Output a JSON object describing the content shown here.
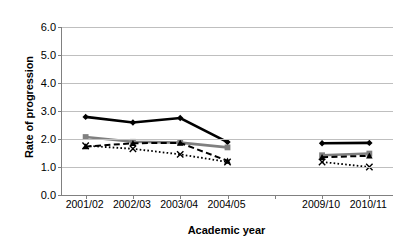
{
  "chart_data": {
    "type": "line",
    "title": "",
    "xlabel": "Academic year",
    "ylabel": "Rate of progression",
    "categories": [
      "2001/02",
      "2002/03",
      "2003/04",
      "2004/05",
      "",
      "2009/10",
      "2010/11"
    ],
    "visible_categories": [
      "2001/02",
      "2002/03",
      "2003/04",
      "2004/05",
      "2009/10",
      "2010/11"
    ],
    "ylim": [
      0.0,
      6.0
    ],
    "ytick_labels": [
      "0.0",
      "1.0",
      "2.0",
      "3.0",
      "4.0",
      "5.0",
      "6.0"
    ],
    "ytick_values": [
      0.0,
      1.0,
      2.0,
      3.0,
      4.0,
      5.0,
      6.0
    ],
    "grid": true,
    "grid_axis": "y",
    "legend": "none",
    "gap_note": "Years 2005/06 to 2008/09 not plotted; series break between 2004/05 and 2009/10",
    "series": [
      {
        "name": "series-1",
        "style": "solid",
        "color": "#000000",
        "marker": "diamond",
        "line_width": 2.6,
        "values": [
          2.79,
          2.59,
          2.75,
          1.89,
          null,
          1.85,
          1.86
        ]
      },
      {
        "name": "series-2",
        "style": "solid",
        "color": "#808080",
        "marker": "square",
        "line_width": 2.6,
        "values": [
          2.07,
          1.9,
          1.87,
          1.7,
          null,
          1.42,
          1.48
        ]
      },
      {
        "name": "series-3",
        "style": "dashed",
        "color": "#000000",
        "marker": "triangle",
        "line_width": 2.0,
        "values": [
          1.73,
          1.85,
          1.86,
          1.22,
          null,
          1.35,
          1.4
        ]
      },
      {
        "name": "series-4",
        "style": "dotted",
        "color": "#000000",
        "marker": "x",
        "line_width": 1.8,
        "values": [
          1.76,
          1.65,
          1.45,
          1.18,
          null,
          1.18,
          1.0
        ]
      }
    ]
  }
}
